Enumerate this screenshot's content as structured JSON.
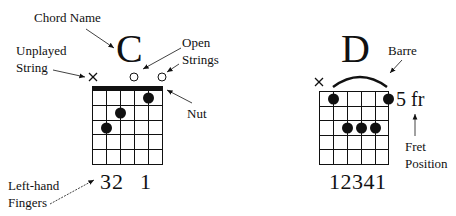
{
  "labels": {
    "chord_name": "Chord Name",
    "unplayed_line1": "Unplayed",
    "unplayed_line2": "String",
    "open_line1": "Open",
    "open_line2": "Strings",
    "nut": "Nut",
    "fingers_line1": "Left-hand",
    "fingers_line2": "Fingers",
    "barre": "Barre",
    "fret_line1": "Fret",
    "fret_line2": "Position"
  },
  "chord_c": {
    "name": "C",
    "string_markers": [
      "×",
      "",
      "",
      "○",
      "",
      "○"
    ],
    "fingers": [
      "3",
      "2",
      "",
      "1",
      "",
      ""
    ],
    "fingers_text": "32 1",
    "dots": [
      {
        "string": 4,
        "fret": 1
      },
      {
        "string": 3,
        "fret": 2
      },
      {
        "string": 2,
        "fret": 3
      }
    ]
  },
  "chord_d": {
    "name": "D",
    "string_markers": [
      "×",
      "",
      "",
      "",
      "",
      ""
    ],
    "fret_position": "5 fr",
    "fingers_text": "12341",
    "dots": [
      {
        "string": 1,
        "fret": 1
      },
      {
        "string": 5,
        "fret": 1
      },
      {
        "string": 2,
        "fret": 3
      },
      {
        "string": 3,
        "fret": 3
      },
      {
        "string": 4,
        "fret": 3
      }
    ]
  },
  "colors": {
    "ink": "#111111",
    "background": "#ffffff"
  }
}
